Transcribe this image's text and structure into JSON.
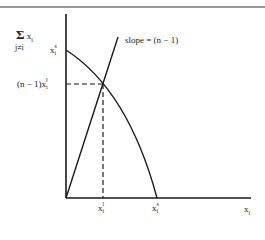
{
  "figure": {
    "y_axis_label": {
      "sum_symbol": "Σ",
      "variable": "x",
      "variable_subscript": "i",
      "index_condition": "j≠i"
    },
    "x_axis_label": {
      "variable": "x",
      "subscript": "i"
    },
    "line_label": "slope = (n − 1)",
    "y_tick_top": {
      "variable": "x",
      "subscript": "i",
      "superscript": "s"
    },
    "y_tick_mid": {
      "prefix": "(n − 1)x",
      "subscript": "i",
      "superscript": "l"
    },
    "x_tick_left": {
      "variable": "x",
      "subscript": "i",
      "superscript": "l"
    },
    "x_tick_right": {
      "variable": "x",
      "subscript": "i",
      "superscript": "s"
    },
    "colors": {
      "line": "#1a1a1a",
      "background": "#ffffff"
    }
  }
}
